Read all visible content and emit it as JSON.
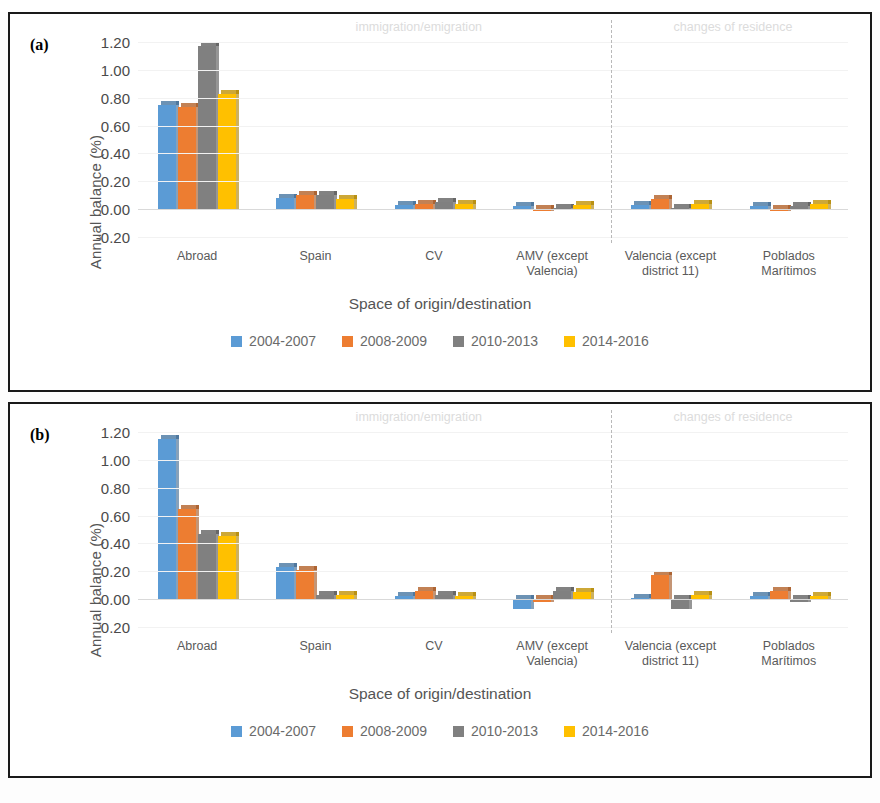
{
  "figure": {
    "panels": [
      {
        "tag": "(a)"
      },
      {
        "tag": "(b)"
      }
    ]
  },
  "colors": {
    "series": [
      "#5B9BD5",
      "#ED7D31",
      "#808080",
      "#FFC000"
    ],
    "annotation": "#dcdcdc",
    "grid": "#f2f2f2",
    "axis_text": "#4a4a4a",
    "frame": "#1a1a1a"
  },
  "legend": {
    "items": [
      {
        "label": "2004-2007",
        "color": "#5B9BD5"
      },
      {
        "label": "2008-2009",
        "color": "#ED7D31"
      },
      {
        "label": "2010-2013",
        "color": "#808080"
      },
      {
        "label": "2014-2016",
        "color": "#FFC000"
      }
    ]
  },
  "annotations": {
    "left": "immigration/emigration",
    "right": "changes of residence"
  },
  "axis": {
    "ylabel": "Annual balance (%)",
    "xlabel": "Space of origin/destination",
    "yticks": [
      "1.20",
      "1.00",
      "0.80",
      "0.60",
      "0.40",
      "0.20",
      "0.00",
      "-0.20"
    ]
  },
  "chart_data": [
    {
      "type": "bar",
      "panel": "(a)",
      "title": "",
      "xlabel": "Space of origin/destination",
      "ylabel": "Annual balance (%)",
      "ylim": [
        -0.2,
        1.2
      ],
      "ytick_values": [
        1.2,
        1.0,
        0.8,
        0.6,
        0.4,
        0.2,
        0.0,
        -0.2
      ],
      "grid": true,
      "legend_position": "bottom",
      "categories": [
        "Abroad",
        "Spain",
        "CV",
        "AMV (except Valencia)",
        "Valencia (except district 11)",
        "Poblados Marítimos"
      ],
      "category_lines": [
        [
          "Abroad"
        ],
        [
          "Spain"
        ],
        [
          "CV"
        ],
        [
          "AMV (except",
          "Valencia)"
        ],
        [
          "Valencia (except",
          "district 11)"
        ],
        [
          "Poblados",
          "Marítimos"
        ]
      ],
      "series": [
        {
          "name": "2004-2007",
          "color": "#5B9BD5",
          "values": [
            0.75,
            0.08,
            0.03,
            0.02,
            0.03,
            0.02
          ]
        },
        {
          "name": "2008-2009",
          "color": "#ED7D31",
          "values": [
            0.73,
            0.1,
            0.04,
            -0.01,
            0.07,
            -0.01
          ]
        },
        {
          "name": "2010-2013",
          "color": "#808080",
          "values": [
            1.17,
            0.1,
            0.05,
            0.01,
            0.01,
            0.02
          ]
        },
        {
          "name": "2014-2016",
          "color": "#FFC000",
          "values": [
            0.83,
            0.07,
            0.04,
            0.03,
            0.04,
            0.04
          ]
        }
      ],
      "annotations": [
        {
          "text": "immigration/emigration",
          "span": "Abroad..AMV (except Valencia)"
        },
        {
          "text": "changes of residence",
          "span": "Valencia (except district 11)..Poblados Marítimos"
        }
      ],
      "divider_after_category": "AMV (except Valencia)"
    },
    {
      "type": "bar",
      "panel": "(b)",
      "title": "",
      "xlabel": "Space of origin/destination",
      "ylabel": "Annual balance (%)",
      "ylim": [
        -0.2,
        1.2
      ],
      "ytick_values": [
        1.2,
        1.0,
        0.8,
        0.6,
        0.4,
        0.2,
        0.0,
        -0.2
      ],
      "grid": true,
      "legend_position": "bottom",
      "categories": [
        "Abroad",
        "Spain",
        "CV",
        "AMV (except Valencia)",
        "Valencia (except district 11)",
        "Poblados Marítimos"
      ],
      "category_lines": [
        [
          "Abroad"
        ],
        [
          "Spain"
        ],
        [
          "CV"
        ],
        [
          "AMV (except",
          "Valencia)"
        ],
        [
          "Valencia (except",
          "district 11)"
        ],
        [
          "Poblados",
          "Marítimos"
        ]
      ],
      "series": [
        {
          "name": "2004-2007",
          "color": "#5B9BD5",
          "values": [
            1.15,
            0.23,
            0.02,
            -0.07,
            0.01,
            0.02
          ]
        },
        {
          "name": "2008-2009",
          "color": "#ED7D31",
          "values": [
            0.65,
            0.21,
            0.06,
            -0.02,
            0.17,
            0.06
          ]
        },
        {
          "name": "2010-2013",
          "color": "#808080",
          "values": [
            0.47,
            0.03,
            0.03,
            0.06,
            -0.07,
            -0.02
          ]
        },
        {
          "name": "2014-2016",
          "color": "#FFC000",
          "values": [
            0.45,
            0.03,
            0.02,
            0.05,
            0.03,
            0.02
          ]
        }
      ],
      "annotations": [
        {
          "text": "immigration/emigration",
          "span": "Abroad..AMV (except Valencia)"
        },
        {
          "text": "changes of residence",
          "span": "Valencia (except district 11)..Poblados Marítimos"
        }
      ],
      "divider_after_category": "AMV (except Valencia)"
    }
  ]
}
